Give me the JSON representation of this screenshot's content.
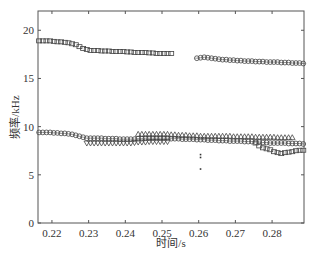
{
  "chart_data": {
    "type": "scatter",
    "title": "",
    "xlabel": "时间/s",
    "ylabel": "频率/kHz",
    "xlim": [
      0.2162,
      0.2887
    ],
    "ylim": [
      0,
      22
    ],
    "xticks": [
      0.22,
      0.23,
      0.24,
      0.25,
      0.26,
      0.27,
      0.28
    ],
    "xtick_labels": [
      "0.22",
      "0.23",
      "0.24",
      "0.25",
      "0.26",
      "0.27",
      "0.28"
    ],
    "yticks": [
      0,
      5,
      10,
      15,
      20
    ],
    "ytick_labels": [
      "0",
      "5",
      "10",
      "15",
      "20"
    ],
    "grid": false,
    "legend": null,
    "series": [
      {
        "name": "upper-square",
        "marker": "square",
        "x": [
          0.2165,
          0.2175,
          0.2185,
          0.2195,
          0.2205,
          0.2215,
          0.2225,
          0.2235,
          0.2245,
          0.2255,
          0.2265,
          0.2275,
          0.2285,
          0.2295,
          0.2305,
          0.2315,
          0.2325,
          0.2335,
          0.2345,
          0.2355,
          0.2365,
          0.2375,
          0.2385,
          0.2395,
          0.2405,
          0.2415,
          0.2425,
          0.2435,
          0.2445,
          0.2455,
          0.2465,
          0.2475,
          0.2485,
          0.2495,
          0.2505,
          0.2515,
          0.2525
        ],
        "y": [
          18.9,
          18.9,
          18.9,
          18.9,
          18.85,
          18.8,
          18.8,
          18.75,
          18.7,
          18.6,
          18.5,
          18.3,
          18.1,
          18.0,
          17.9,
          17.9,
          17.9,
          17.85,
          17.85,
          17.85,
          17.8,
          17.8,
          17.8,
          17.8,
          17.75,
          17.75,
          17.7,
          17.7,
          17.7,
          17.7,
          17.65,
          17.65,
          17.6,
          17.6,
          17.6,
          17.6,
          17.6
        ]
      },
      {
        "name": "upper-circle",
        "marker": "circle",
        "x": [
          0.2595,
          0.2605,
          0.2615,
          0.2625,
          0.2635,
          0.2645,
          0.2655,
          0.2665,
          0.2675,
          0.2685,
          0.2695,
          0.2705,
          0.2715,
          0.2725,
          0.2735,
          0.2745,
          0.2755,
          0.2765,
          0.2775,
          0.2785,
          0.2795,
          0.2805,
          0.2815,
          0.2825,
          0.2835,
          0.2845,
          0.2855,
          0.2865,
          0.2875,
          0.2885
        ],
        "y": [
          17.1,
          17.15,
          17.2,
          17.15,
          17.1,
          17.05,
          17.0,
          16.95,
          16.95,
          16.9,
          16.9,
          16.85,
          16.85,
          16.8,
          16.8,
          16.8,
          16.75,
          16.75,
          16.75,
          16.7,
          16.7,
          16.7,
          16.7,
          16.65,
          16.65,
          16.65,
          16.6,
          16.6,
          16.6,
          16.55
        ]
      },
      {
        "name": "lower-circle",
        "marker": "circle",
        "x": [
          0.2165,
          0.2175,
          0.2185,
          0.2195,
          0.2205,
          0.2215,
          0.2225,
          0.2235,
          0.2245,
          0.2255,
          0.2265,
          0.2275,
          0.2285,
          0.2295,
          0.2305,
          0.2315,
          0.2325,
          0.2335,
          0.2345,
          0.2355,
          0.2365,
          0.2375,
          0.2385,
          0.2395,
          0.2405,
          0.2415,
          0.2425,
          0.2435,
          0.2445,
          0.2455,
          0.2465,
          0.2475,
          0.2485,
          0.2495,
          0.2505,
          0.2515,
          0.2525,
          0.2535,
          0.2545,
          0.2555,
          0.2565,
          0.2575,
          0.2585,
          0.2595,
          0.2605,
          0.2615,
          0.2625,
          0.2635,
          0.2645,
          0.2655,
          0.2665,
          0.2675,
          0.2685,
          0.2695,
          0.2705,
          0.2715,
          0.2725,
          0.2735,
          0.2745,
          0.2755,
          0.2765,
          0.2775,
          0.2785,
          0.2795,
          0.2805,
          0.2815,
          0.2825,
          0.2835,
          0.2845,
          0.2855,
          0.2865,
          0.2875,
          0.2885
        ],
        "y": [
          9.4,
          9.4,
          9.4,
          9.4,
          9.35,
          9.35,
          9.3,
          9.3,
          9.25,
          9.2,
          9.1,
          9.0,
          8.9,
          8.8,
          8.8,
          8.8,
          8.8,
          8.8,
          8.75,
          8.75,
          8.75,
          8.75,
          8.7,
          8.7,
          8.7,
          8.7,
          8.7,
          8.75,
          8.75,
          8.8,
          8.8,
          8.8,
          8.8,
          8.8,
          8.8,
          8.8,
          8.75,
          8.75,
          8.75,
          8.7,
          8.7,
          8.7,
          8.7,
          8.65,
          8.65,
          8.65,
          8.6,
          8.6,
          8.6,
          8.55,
          8.55,
          8.55,
          8.5,
          8.5,
          8.5,
          8.5,
          8.45,
          8.45,
          8.45,
          8.4,
          8.4,
          8.35,
          8.35,
          8.3,
          8.3,
          8.3,
          8.3,
          8.3,
          8.25,
          8.25,
          8.25,
          8.25,
          8.2
        ]
      },
      {
        "name": "triangle-up",
        "marker": "triangle",
        "x": [
          0.2435,
          0.2445,
          0.2455,
          0.2465,
          0.2475,
          0.2485,
          0.2495,
          0.2505,
          0.2515,
          0.2525,
          0.2535,
          0.2545,
          0.2555,
          0.2565,
          0.2575,
          0.2585,
          0.2595,
          0.2605,
          0.2615,
          0.2625,
          0.2635,
          0.2645,
          0.2655,
          0.2665,
          0.2675,
          0.2685,
          0.2695,
          0.2705,
          0.2715,
          0.2725,
          0.2735,
          0.2745,
          0.2755,
          0.2765,
          0.2775,
          0.2785,
          0.2795,
          0.2805,
          0.2815,
          0.2825,
          0.2835,
          0.2845,
          0.2855
        ],
        "y": [
          9.2,
          9.2,
          9.2,
          9.2,
          9.2,
          9.2,
          9.2,
          9.2,
          9.2,
          9.15,
          9.15,
          9.1,
          9.1,
          9.1,
          9.05,
          9.05,
          9.05,
          9.0,
          9.0,
          9.0,
          9.0,
          9.0,
          9.0,
          9.0,
          9.0,
          9.0,
          8.95,
          8.95,
          8.95,
          8.95,
          8.95,
          8.95,
          8.9,
          8.9,
          8.9,
          8.9,
          8.9,
          8.9,
          8.85,
          8.85,
          8.85,
          8.85,
          8.85
        ]
      },
      {
        "name": "triangle-down",
        "marker": "triangle-down",
        "x": [
          0.2295,
          0.2305,
          0.2315,
          0.2325,
          0.2335,
          0.2345,
          0.2355,
          0.2365,
          0.2375,
          0.2385,
          0.2395,
          0.2405,
          0.2415,
          0.2425,
          0.2435,
          0.2445,
          0.2455,
          0.2465,
          0.2475,
          0.2485,
          0.2495,
          0.2505,
          0.2515
        ],
        "y": [
          8.3,
          8.3,
          8.3,
          8.3,
          8.3,
          8.3,
          8.3,
          8.3,
          8.3,
          8.3,
          8.3,
          8.3,
          8.3,
          8.35,
          8.4,
          8.4,
          8.4,
          8.45,
          8.45,
          8.45,
          8.45,
          8.45,
          8.45
        ]
      },
      {
        "name": "lower-square",
        "marker": "square",
        "x": [
          0.2755,
          0.2765,
          0.2775,
          0.2785,
          0.2795,
          0.2805,
          0.2815,
          0.2825,
          0.2835,
          0.2845,
          0.2855,
          0.2865,
          0.2875,
          0.2885
        ],
        "y": [
          8.3,
          8.0,
          7.8,
          7.7,
          7.6,
          7.4,
          7.3,
          7.2,
          7.3,
          7.35,
          7.4,
          7.5,
          7.55,
          7.55
        ]
      },
      {
        "name": "outlier-dots",
        "marker": "dot",
        "x": [
          0.2605,
          0.2605,
          0.2605
        ],
        "y": [
          7.1,
          6.8,
          5.6
        ]
      }
    ]
  }
}
